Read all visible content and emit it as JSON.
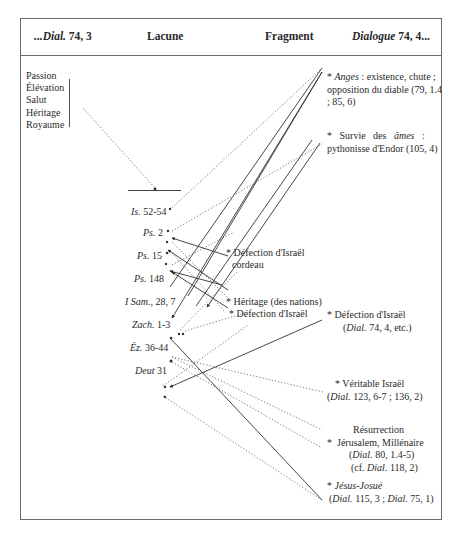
{
  "header": {
    "col1_italic": "...Dial.",
    "col1_rest": " 74, 3",
    "col2": "Lacune",
    "col3": "Fragment",
    "col4_italic": "Dialogue",
    "col4_rest": " 74, 4..."
  },
  "left_themes": [
    "Passion",
    "Élévation",
    "Salut",
    "Héritage",
    "Royaume"
  ],
  "lacune_refs": [
    {
      "book": "Is.",
      "ref": " 52-54"
    },
    {
      "book": "Ps.",
      "ref": " 2"
    },
    {
      "book": "Ps.",
      "ref": " 15"
    },
    {
      "book": "Ps.",
      "ref": " 148"
    },
    {
      "book": "I Sam.",
      "ref": ", 28, 7"
    },
    {
      "book": "Zach.",
      "ref": " 1-3"
    },
    {
      "book": "Éz.",
      "ref": " 36-44"
    },
    {
      "book": "Deut",
      "ref": " 31"
    }
  ],
  "fragment": {
    "item1_line1": "* Défection d'Israël",
    "item1_line2": "cordeau",
    "item2": "* Héritage (des nations)",
    "item3": "* Défection d'Israël"
  },
  "dialogue": {
    "anges_star": "* ",
    "anges_word": "Anges",
    "anges_rest": " : existence, chute ;",
    "anges_line2": "opposition du diable (79, 1.4",
    "anges_line3": "; 85, 6)",
    "ames_star": "*   Survie   des   ",
    "ames_word": "âmes",
    "ames_rest": "   :",
    "ames_line2": "pythonisse d'Endor (105, 4)",
    "defection_line1": "* Défection d'Israël",
    "defection_ref_italic": "Dial.",
    "defection_ref_rest": " 74, 4, etc.)",
    "veritable_line1": "* Véritable Israël",
    "veritable_ref_italic": "Dial.",
    "veritable_ref_rest": " 123, 6-7 ; 136, 2)",
    "resurrection_line1": "Résurrection",
    "resurrection_line2": "*  Jérusalem, Millénaire",
    "resurrection_ref1_italic": "Dial.",
    "resurrection_ref1_rest": " 80, 1.4-5)",
    "resurrection_ref2_pre": "(cf. ",
    "resurrection_ref2_italic": "Dial.",
    "resurrection_ref2_rest": " 118, 2)",
    "jesus_star": "* ",
    "jesus_word": "Jésus-Josué",
    "jesus_ref_italic1": "Dial.",
    "jesus_ref_mid": " 115, 3 ; ",
    "jesus_ref_italic2": "Dial.",
    "jesus_ref_rest": " 75, 1)"
  },
  "colors": {
    "frame": "#6a6a6a",
    "text": "#2a2a2a",
    "line": "#333333"
  }
}
